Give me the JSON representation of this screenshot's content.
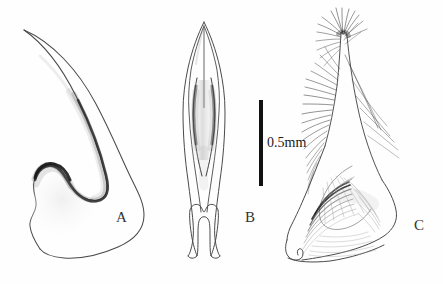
{
  "figure": {
    "type": "scientific-line-drawing",
    "background_color": "#fefefe",
    "ink_color": "#333333",
    "width": 443,
    "height": 284,
    "panels": [
      {
        "id": "A",
        "label": "A",
        "label_x": 116,
        "label_y": 210,
        "subject": "curved-hooked-sclerite-lateral-view",
        "description": "Elongate, strongly curved sickle-shaped structure tapering to a fine apex at upper left, with a rounded basal lobe and a dark shaded inner hook near the base."
      },
      {
        "id": "B",
        "label": "B",
        "label_x": 245,
        "label_y": 210,
        "subject": "symmetrical-bifid-sclerite-ventral-view",
        "description": "Narrow, bilaterally symmetrical spear-shaped structure with an acute apex, paired longitudinal internal rods shaded medially, and a U-notched forked base with two prongs."
      },
      {
        "id": "C",
        "label": "C",
        "label_x": 414,
        "label_y": 218,
        "subject": "setose-valve-with-dense-bristles",
        "description": "Broad lobate structure bearing a slender apical process crowned with a dense tuft of fine setae; the dorsal margin carries rows of long bristles and the body shows concentric arc-like striations; the base ends in a notched hooked tip."
      }
    ],
    "scale_bar": {
      "label": "0.5mm",
      "orientation": "vertical",
      "x": 259,
      "y": 100,
      "width": 4,
      "height": 86,
      "color": "#111111",
      "text_x": 267,
      "text_y": 136
    }
  }
}
